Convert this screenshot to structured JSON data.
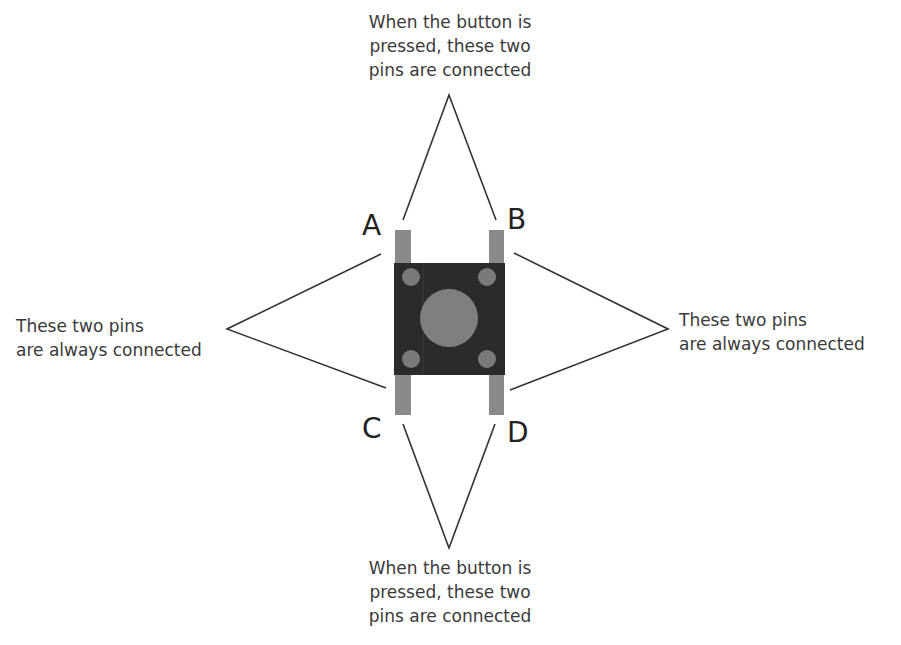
{
  "diagram": {
    "pins": [
      {
        "id": "A",
        "label": "A"
      },
      {
        "id": "B",
        "label": "B"
      },
      {
        "id": "C",
        "label": "C"
      },
      {
        "id": "D",
        "label": "D"
      }
    ],
    "annotations": {
      "top": {
        "line1": "When the button is",
        "line2": "pressed, these two",
        "line3": "pins are connected",
        "pins": [
          "A",
          "B"
        ]
      },
      "left": {
        "line1": "These two pins",
        "line2": "are always connected",
        "pins": [
          "A",
          "C"
        ]
      },
      "right": {
        "line1": "These two pins",
        "line2": "are always connected",
        "pins": [
          "B",
          "D"
        ]
      },
      "bottom": {
        "line1": "When the button is",
        "line2": "pressed, these two",
        "line3": "pins are connected",
        "pins": [
          "C",
          "D"
        ]
      }
    },
    "colors": {
      "body": "#2b2b2b",
      "pin": "#8a8a8a",
      "button": "#7f7f7f",
      "line": "#333333",
      "text": "#3a3a3a"
    }
  }
}
